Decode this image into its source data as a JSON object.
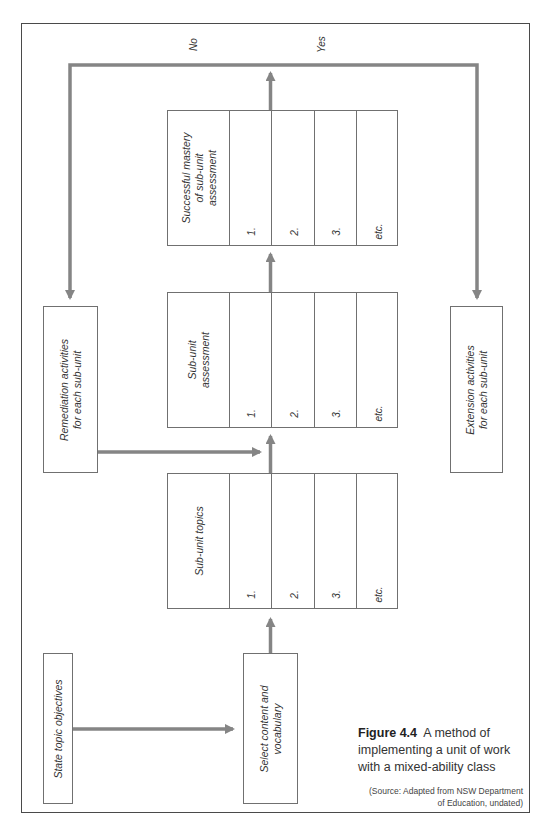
{
  "figure": {
    "number_label": "Figure 4.4",
    "title": "A method of implementing a unit of work with a mixed-ability class",
    "source": "(Source: Adapted from NSW Department of Education, undated)",
    "source_line1": "(Source: Adapted from NSW Department",
    "source_line2": "of Education, undated)"
  },
  "colors": {
    "arrow": "#858585",
    "box_border": "#707070",
    "frame_border": "#4a4a4a",
    "text": "#333333"
  },
  "decision_labels": {
    "no": "No",
    "yes": "Yes"
  },
  "boxes": {
    "state_objectives": "State topic objectives",
    "select_content_line1": "Select content and",
    "select_content_line2": "vocabulary",
    "remediation_line1": "Remediation activities",
    "remediation_line2": "for each sub-unit",
    "extension_line1": "Extension activities",
    "extension_line2": "for each sub-unit"
  },
  "tables": [
    {
      "header_lines": [
        "Sub-unit topics"
      ],
      "items": [
        "1.",
        "2.",
        "3.",
        "etc."
      ]
    },
    {
      "header_lines": [
        "Sub-unit",
        "assessment"
      ],
      "items": [
        "1.",
        "2.",
        "3.",
        "etc."
      ]
    },
    {
      "header_lines": [
        "Successful mastery",
        "of sub-unit",
        "assessment"
      ],
      "items": [
        "1.",
        "2.",
        "3.",
        "etc."
      ]
    }
  ]
}
